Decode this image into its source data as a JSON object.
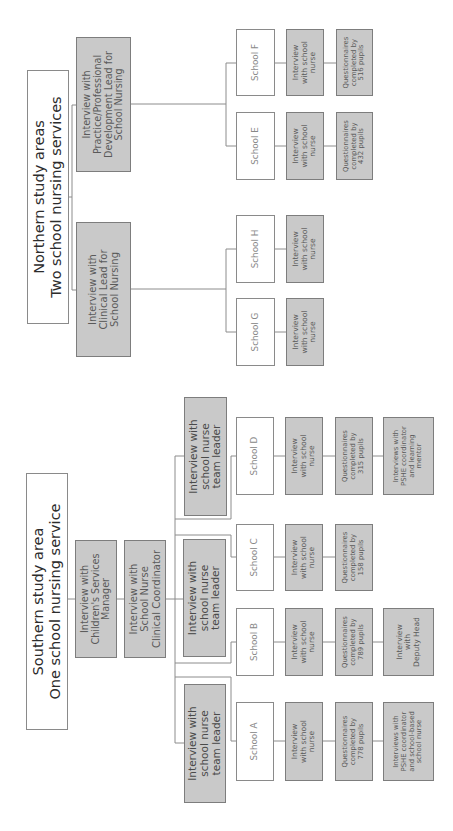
{
  "northern": {
    "title": "Northern study areas\nTwo school nursing services",
    "leads": [
      {
        "label": "Interview with\nPractice/Professional\nDevelopment Lead for\nSchool Nursing"
      },
      {
        "label": "Interview with\nClinical Lead for\nSchool Nursing"
      }
    ],
    "schools": [
      {
        "name": "School F",
        "interview": "Interview\nwith school\nnurse",
        "questionnaire": "Questionnaires\ncompleted by\n516 pupils"
      },
      {
        "name": "School E",
        "interview": "Interview\nwith school\nnurse",
        "questionnaire": "Questionnaires\ncompleted by\n432 pupils"
      },
      {
        "name": "School H",
        "interview": "Interview\nwith school\nnurse"
      },
      {
        "name": "School G",
        "interview": "Interview\nwith school\nnurse"
      }
    ]
  },
  "southern": {
    "title": "Southern study area\nOne school nursing service",
    "manager": "Interview with\nChildren's Services\nManager",
    "coordinator": "Interview with\nSchool Nurse\nClinical Coordinator",
    "team_leaders": [
      {
        "label": "Interview with\nschool nurse\nteam leader"
      },
      {
        "label": "Interview with\nschool nurse\nteam leader"
      },
      {
        "label": "Interview with\nschool nurse\nteam leader"
      }
    ],
    "schools": [
      {
        "name": "School D",
        "interview": "Interview\nwith school\nnurse",
        "questionnaire": "Questionnaires\ncompleted by\n315 pupils",
        "extra": "Interviews with\nPSHE coordinator\nand learning\nmentor"
      },
      {
        "name": "School C",
        "interview": "Interview\nwith school\nnurse",
        "questionnaire": "Questionnaires\ncompleted by\n158 pupils"
      },
      {
        "name": "School B",
        "interview": "Interview\nwith school\nnurse",
        "questionnaire": "Questionnaires\ncompleted by\n789 pupils",
        "extra": "Interview\nwith\nDeputy Head"
      },
      {
        "name": "School A",
        "interview": "Interview\nwith school\nnurse",
        "questionnaire": "Questionnaires\ncompleted by\n778 pupils",
        "extra": "Interviews with\nPSHE coordinator\nand school-based\nschool nurse"
      }
    ]
  },
  "colors": {
    "gray_fill": "#c9c9c9",
    "border": "#7d7d7d",
    "line": "#8c8c8c"
  }
}
